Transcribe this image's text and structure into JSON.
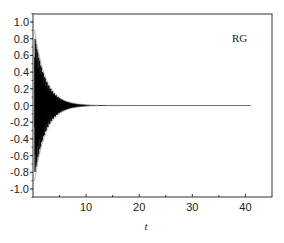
{
  "chart_data": {
    "type": "line",
    "title": "",
    "xlabel": "t",
    "ylabel": "",
    "xlim": [
      0,
      45
    ],
    "ylim": [
      -1.1,
      1.1
    ],
    "x_ticks": [
      "10",
      "20",
      "30",
      "40"
    ],
    "y_ticks": [
      "1.0",
      "0.8",
      "0.6",
      "0.4",
      "0.2",
      "0.0",
      "-0.2",
      "-0.4",
      "-0.6",
      "-0.8",
      "-1.0"
    ],
    "grid": false,
    "legend": {
      "position": "top-right",
      "entries": [
        "RG"
      ]
    },
    "series": [
      {
        "name": "RG",
        "description": "Rapidly oscillating signal with exponentially decaying envelope, starting near amplitude 1.0 at t≈0 and decaying to ~0 by t≈8, then flat at 0.0 until t≈41",
        "envelope_x": [
          0,
          1,
          2,
          3,
          4,
          5,
          6,
          7,
          8,
          10,
          41
        ],
        "envelope_upper": [
          1.0,
          0.62,
          0.38,
          0.23,
          0.14,
          0.08,
          0.04,
          0.02,
          0.01,
          0.0,
          0.0
        ],
        "envelope_lower": [
          -1.0,
          -0.62,
          -0.38,
          -0.23,
          -0.14,
          -0.08,
          -0.04,
          -0.02,
          -0.01,
          0.0,
          0.0
        ]
      }
    ]
  }
}
